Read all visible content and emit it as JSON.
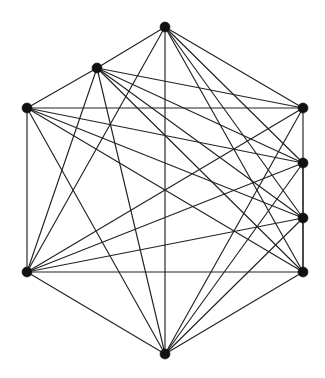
{
  "figure": {
    "type": "node-link-diagram",
    "background_color": "#ffffff",
    "node_color": "#111111",
    "edge_color": "#222222",
    "node_radius": 5,
    "edge_width": 1.15,
    "width": 325,
    "height": 378,
    "node_count": 8,
    "edge_count": 31
  },
  "chart_data": {
    "type": "graph",
    "xlabel": "",
    "ylabel": "",
    "grid": false,
    "legend": "none",
    "node_count": 8,
    "edge_count": 31,
    "nodes": [
      {
        "id": "n0",
        "label": "top",
        "x": 165,
        "y": 27
      },
      {
        "id": "n1",
        "label": "upper-left",
        "x": 97,
        "y": 68
      },
      {
        "id": "n2",
        "label": "left",
        "x": 27,
        "y": 108
      },
      {
        "id": "n3",
        "label": "right-1",
        "x": 303,
        "y": 108
      },
      {
        "id": "n4",
        "label": "right-2",
        "x": 303,
        "y": 163
      },
      {
        "id": "n5",
        "label": "right-3",
        "x": 303,
        "y": 218
      },
      {
        "id": "n6",
        "label": "right-4",
        "x": 303,
        "y": 272
      },
      {
        "id": "n7",
        "label": "bottom-left",
        "x": 27,
        "y": 272
      },
      {
        "id": "n8",
        "label": "bottom",
        "x": 165,
        "y": 354
      }
    ],
    "edges": [
      {
        "source": "n0",
        "target": "n1"
      },
      {
        "source": "n0",
        "target": "n3"
      },
      {
        "source": "n0",
        "target": "n4"
      },
      {
        "source": "n0",
        "target": "n5"
      },
      {
        "source": "n0",
        "target": "n6"
      },
      {
        "source": "n0",
        "target": "n7"
      },
      {
        "source": "n0",
        "target": "n8"
      },
      {
        "source": "n1",
        "target": "n3"
      },
      {
        "source": "n1",
        "target": "n4"
      },
      {
        "source": "n1",
        "target": "n5"
      },
      {
        "source": "n1",
        "target": "n6"
      },
      {
        "source": "n1",
        "target": "n7"
      },
      {
        "source": "n1",
        "target": "n8"
      },
      {
        "source": "n2",
        "target": "n3"
      },
      {
        "source": "n2",
        "target": "n4"
      },
      {
        "source": "n2",
        "target": "n5"
      },
      {
        "source": "n2",
        "target": "n6"
      },
      {
        "source": "n2",
        "target": "n7"
      },
      {
        "source": "n2",
        "target": "n8"
      },
      {
        "source": "n3",
        "target": "n7"
      },
      {
        "source": "n3",
        "target": "n8"
      },
      {
        "source": "n4",
        "target": "n7"
      },
      {
        "source": "n4",
        "target": "n8"
      },
      {
        "source": "n5",
        "target": "n7"
      },
      {
        "source": "n5",
        "target": "n8"
      },
      {
        "source": "n6",
        "target": "n7"
      },
      {
        "source": "n6",
        "target": "n8"
      },
      {
        "source": "n7",
        "target": "n8"
      },
      {
        "source": "n2",
        "target": "n1"
      },
      {
        "source": "n3",
        "target": "n6"
      },
      {
        "source": "n4",
        "target": "n6"
      }
    ]
  }
}
